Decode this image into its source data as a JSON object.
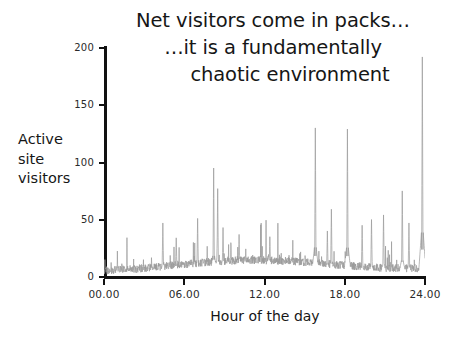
{
  "slide": {
    "background_color": "#ffffff",
    "title": {
      "line1": "Net visitors come in packs…",
      "line2": "…it is a fundamentally",
      "line3": "chaotic environment"
    },
    "y_caption": {
      "line1": "Active",
      "line2": "site",
      "line3": "visitors"
    }
  },
  "chart_data": {
    "type": "line",
    "title": "Net visitors come in packs… …it is a fundamentally chaotic environment",
    "xlabel": "Hour of the day",
    "ylabel": "Active site visitors",
    "grid": false,
    "legend": false,
    "line_color": "#9a9a9a",
    "axis_color": "#111111",
    "xlim": [
      0,
      24
    ],
    "ylim": [
      0,
      200
    ],
    "y_ticks": [
      0,
      50,
      100,
      150,
      200
    ],
    "y_tick_labels": [
      "0",
      "50",
      "100",
      "150",
      "200"
    ],
    "x_ticks": [
      0,
      6,
      12,
      18,
      24
    ],
    "x_tick_labels": [
      "00.00",
      "06.00",
      "12.00",
      "18.00",
      "24.00"
    ],
    "series_name": "Active site visitors",
    "notable_peaks": [
      {
        "hour": 4.4,
        "value": 40
      },
      {
        "hour": 5.4,
        "value": 27
      },
      {
        "hour": 7.0,
        "value": 44
      },
      {
        "hour": 8.2,
        "value": 88
      },
      {
        "hour": 8.5,
        "value": 70
      },
      {
        "hour": 8.9,
        "value": 36
      },
      {
        "hour": 10.1,
        "value": 30
      },
      {
        "hour": 12.4,
        "value": 28
      },
      {
        "hour": 15.8,
        "value": 123
      },
      {
        "hour": 16.7,
        "value": 33
      },
      {
        "hour": 17.0,
        "value": 52
      },
      {
        "hour": 18.2,
        "value": 122
      },
      {
        "hour": 19.3,
        "value": 38
      },
      {
        "hour": 20.0,
        "value": 43
      },
      {
        "hour": 20.9,
        "value": 47
      },
      {
        "hour": 22.3,
        "value": 68
      },
      {
        "hour": 22.8,
        "value": 40
      },
      {
        "hour": 23.8,
        "value": 185
      }
    ],
    "baseline_mean": 9,
    "baseline_noise": 7,
    "n_points": 1440
  }
}
